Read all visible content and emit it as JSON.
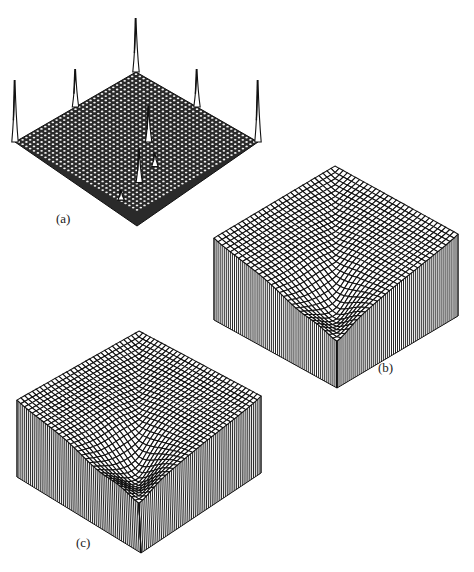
{
  "figure": {
    "panels": [
      {
        "id": "a",
        "label": "(a)",
        "type": "spike-plane",
        "label_pos": [
          56,
          222
        ],
        "corners": {
          "top": [
            136,
            72
          ],
          "right": [
            258,
            142
          ],
          "bottom": [
            137,
            226
          ],
          "left": [
            15,
            142
          ]
        },
        "grid_n": 32,
        "spikes": [
          {
            "u": 0.0,
            "v": 0.0,
            "height": 54
          },
          {
            "u": 0.5,
            "v": 0.0,
            "height": 38
          },
          {
            "u": 0.0,
            "v": 0.5,
            "height": 38
          },
          {
            "u": 1.0,
            "v": 0.0,
            "height": 62
          },
          {
            "u": 0.0,
            "v": 1.0,
            "height": 62
          },
          {
            "u": 0.55,
            "v": 0.45,
            "height": 36
          },
          {
            "u": 0.75,
            "v": 0.6,
            "height": 14
          },
          {
            "u": 0.8,
            "v": 0.78,
            "height": 34
          },
          {
            "u": 0.85,
            "v": 0.98,
            "height": 10
          }
        ]
      },
      {
        "id": "b",
        "label": "(b)",
        "type": "valley-block",
        "label_pos": [
          378,
          371
        ],
        "corners": {
          "top": [
            335,
            166
          ],
          "right": [
            458,
            234
          ],
          "bottom": [
            337,
            306
          ],
          "left": [
            214,
            238
          ]
        },
        "base_drop": 82,
        "grid_n": 30,
        "depth": 62,
        "trough_center": [
          0.72,
          0.82
        ],
        "trough_strength": 1.0
      },
      {
        "id": "c",
        "label": "(c)",
        "type": "valley-block",
        "label_pos": [
          76,
          546
        ],
        "corners": {
          "top": [
            139,
            331
          ],
          "right": [
            261,
            396
          ],
          "bottom": [
            141,
            476
          ],
          "left": [
            17,
            400
          ]
        },
        "base_drop": 77,
        "grid_n": 32,
        "depth": 68,
        "trough_center": [
          0.7,
          0.8
        ],
        "trough_strength": 1.15
      }
    ],
    "colors": {
      "ink": "#111111",
      "paper": "#ffffff"
    }
  }
}
